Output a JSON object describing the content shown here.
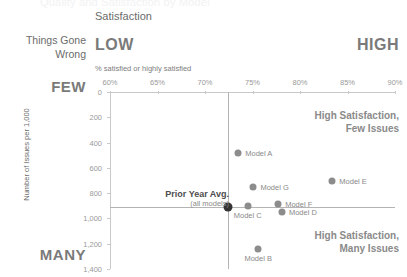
{
  "header": {
    "cut_title": "Quality and Satisfaction by Model",
    "satisfaction_label": "Satisfaction",
    "things_gone_wrong_label": "Things Gone\nWrong",
    "low_label": "LOW",
    "high_label": "HIGH",
    "few_label": "FEW",
    "many_label": "MANY"
  },
  "annotations": {
    "prior_year_avg_line1": "Prior Year Avg.",
    "prior_year_avg_line2": "(all models)",
    "quadrant_top_right_line1": "High Satisfaction,",
    "quadrant_top_right_line2": "Few Issues",
    "quadrant_bottom_right_line1": "High Satisfaction,",
    "quadrant_bottom_right_line2": "Many Issues"
  },
  "colors": {
    "point": "#8c8c8c",
    "average_point": "#333333",
    "axis": "#c9c9c9",
    "reference_line": "#b4b4b4",
    "text": "#8a8a8a",
    "heading": "#7a7a7a"
  },
  "chart_data": {
    "type": "scatter",
    "title": "Quality and Satisfaction by Model",
    "xlabel": "% satisfied or highly satisfied",
    "ylabel": "Number of Issues per 1,000",
    "xlim": [
      60,
      90
    ],
    "ylim": [
      0,
      1400
    ],
    "y_inverted": true,
    "grid": false,
    "legend": "none",
    "xticks": [
      "60%",
      "65%",
      "70%",
      "75%",
      "80%",
      "85%",
      "90%"
    ],
    "xtick_values": [
      60,
      65,
      70,
      75,
      80,
      85,
      90
    ],
    "yticks": [
      "0",
      "200",
      "400",
      "600",
      "800",
      "1,000",
      "1,200",
      "1,400"
    ],
    "ytick_values": [
      0,
      200,
      400,
      600,
      800,
      1000,
      1200,
      1400
    ],
    "reference_lines": {
      "x": 72.4,
      "y": 910,
      "label": "Prior Year Avg. (all models)"
    },
    "points": [
      {
        "name": "Model A",
        "x": 73.5,
        "y": 480,
        "label_pos": "right"
      },
      {
        "name": "Model E",
        "x": 83.4,
        "y": 705,
        "label_pos": "right"
      },
      {
        "name": "Model G",
        "x": 75.1,
        "y": 750,
        "label_pos": "right"
      },
      {
        "name": "Prior Year Avg.",
        "x": 72.4,
        "y": 910,
        "label_pos": "none",
        "highlight": true
      },
      {
        "name": "Model F",
        "x": 77.7,
        "y": 885,
        "label_pos": "right"
      },
      {
        "name": "Model C",
        "x": 74.5,
        "y": 900,
        "label_pos": "below"
      },
      {
        "name": "Model D",
        "x": 78.1,
        "y": 950,
        "label_pos": "right"
      },
      {
        "name": "Model B",
        "x": 75.6,
        "y": 1240,
        "label_pos": "below"
      }
    ]
  }
}
